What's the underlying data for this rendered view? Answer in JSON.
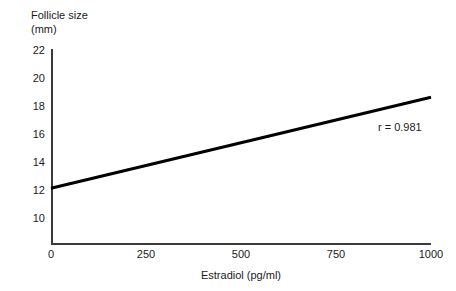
{
  "chart_data": {
    "type": "line",
    "title": "",
    "subtitle": "",
    "xlabel": "Estradiol (pg/ml)",
    "ylabel": "Follicle size",
    "ylabel_units": "(mm)",
    "ylabel_lines": [
      "Follicle size",
      "(mm)"
    ],
    "xlim": [
      0,
      1000
    ],
    "ylim": [
      8.9,
      22
    ],
    "xticks": [
      0,
      250,
      500,
      750,
      1000
    ],
    "xticklabels": [
      "0",
      "250",
      "500",
      "750",
      "1000"
    ],
    "yticks": [
      10,
      12,
      14,
      16,
      18,
      20,
      22
    ],
    "yticklabels": [
      "10",
      "12",
      "14",
      "16",
      "18",
      "20",
      "22"
    ],
    "grid": false,
    "legend": false,
    "legend_position": "none",
    "series": [
      {
        "name": "regression-line",
        "x": [
          0,
          1000
        ],
        "values": [
          12.2,
          18.7
        ],
        "color": "#000000",
        "linewidth": 3
      }
    ],
    "annotations": [
      {
        "name": "correlation-coefficient",
        "text": "r = 0.981",
        "x": 860,
        "y": 16.5
      }
    ],
    "axis_color": "#3a3a3a",
    "text_color": "#1a1a1a",
    "background": "#ffffff"
  }
}
